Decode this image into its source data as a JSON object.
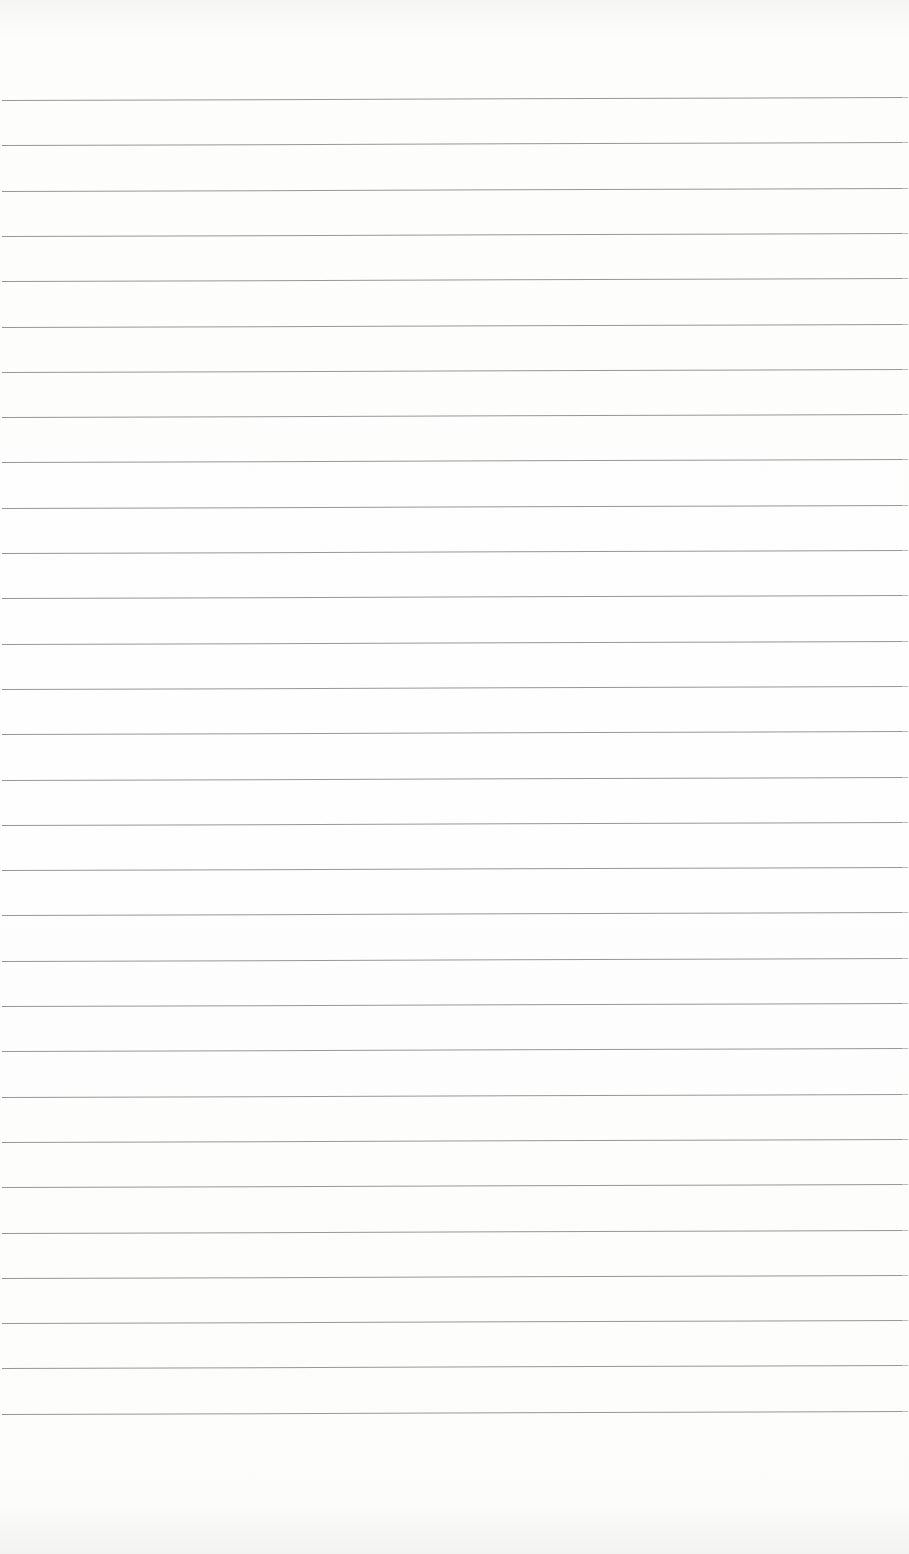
{
  "sheet": {
    "type": "ruled-paper",
    "background_color": "#fdfdfc",
    "rule_color": "#8c8c8c",
    "rule_count": 30,
    "first_rule_y": 100,
    "rule_spacing": 45.3,
    "text": ""
  }
}
